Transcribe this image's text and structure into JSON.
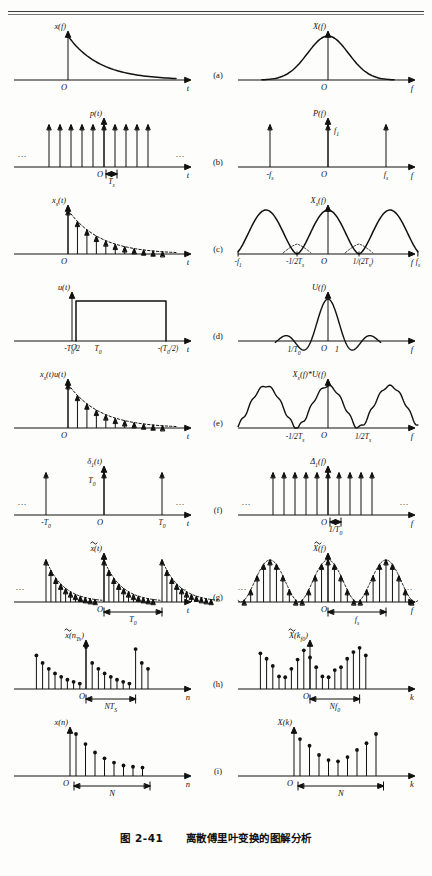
{
  "header": {
    "running_head": ""
  },
  "caption": {
    "figure_number": "图 2-41",
    "title": "离散傅里叶变换的图解分析"
  },
  "axes": {
    "t": "t",
    "f": "f",
    "n": "n",
    "k": "k",
    "origin": "O"
  },
  "rows": [
    {
      "key": "a",
      "label": "(a)",
      "left": {
        "name": "x(f)",
        "ylabel": "x(f)",
        "xlabel": "t",
        "kind": "exp-decay-curve",
        "description": "exponential decaying continuous signal starting at O"
      },
      "right": {
        "name": "X(f)",
        "ylabel": "X(f)",
        "xlabel": "f",
        "kind": "bell-curve",
        "description": "smooth bell shaped continuous spectrum centred at O"
      }
    },
    {
      "key": "b",
      "label": "(b)",
      "left": {
        "name": "p(t)",
        "ylabel": "p(t)",
        "xlabel": "t",
        "kind": "impulse-train",
        "ticks": [
          "O"
        ],
        "span_label": "T s",
        "ellipsis": "…"
      },
      "right": {
        "name": "P(f)",
        "ylabel": "P(f)",
        "xlabel": "f",
        "kind": "three-impulses",
        "ticks": [
          "-f s",
          "O",
          "f s"
        ],
        "amplitude_label": "f 1"
      }
    },
    {
      "key": "c",
      "label": "(c)",
      "left": {
        "name": "x s(t)",
        "ylabel": "x s(t)",
        "xlabel": "t",
        "kind": "sampled-exp",
        "ticks": [
          "O"
        ]
      },
      "right": {
        "name": "X s(f)",
        "ylabel": "X s(f)",
        "xlabel": "f",
        "kind": "periodic-spectrum",
        "ticks": [
          "-f 1",
          "-1/2T s",
          "O",
          "1/(2T s)",
          "f s"
        ]
      }
    },
    {
      "key": "d",
      "label": "(d)",
      "left": {
        "name": "u(t)",
        "ylabel": "u(t)",
        "xlabel": "t",
        "kind": "rect-window",
        "ticks": [
          "-T 0/2",
          "O",
          "T 0",
          "-(T 0/2)"
        ]
      },
      "right": {
        "name": "U(f)",
        "ylabel": "U(f)",
        "xlabel": "f",
        "kind": "sinc",
        "ticks": [
          "1/T 0",
          "O",
          "1"
        ]
      }
    },
    {
      "key": "e",
      "label": "(e)",
      "left": {
        "name": "x s(t)u(t)",
        "ylabel": "x s(t)u(t)",
        "xlabel": "t",
        "kind": "sampled-exp",
        "ticks": [
          "O"
        ]
      },
      "right": {
        "name": "X s(f)*U(f)",
        "ylabel": "X s(f)*U(f)",
        "xlabel": "f",
        "kind": "rippled-periodic",
        "ticks": [
          "-1/2T s",
          "O",
          "1/2T s"
        ]
      }
    },
    {
      "key": "f",
      "label": "(f)",
      "left": {
        "name": "δ 1(t)",
        "ylabel": "δ 1(t)",
        "xlabel": "t",
        "kind": "sparse-impulses",
        "ticks": [
          "-T 0",
          "O",
          "T 0"
        ],
        "amplitude_label": "T 0",
        "ellipsis": "…"
      },
      "right": {
        "name": "Δ 1(f)",
        "ylabel": "Δ 1(f)",
        "xlabel": "f",
        "kind": "impulse-train",
        "ticks": [
          "O"
        ],
        "span_label": "1/T 0",
        "ellipsis": "…"
      }
    },
    {
      "key": "g",
      "label": "(g)",
      "left": {
        "name": "x~(t)",
        "ylabel": "x(t)",
        "xlabel": "t",
        "kind": "periodic-sampled-exp",
        "span_label": "T 0",
        "ellipsis": "…",
        "tilde": true
      },
      "right": {
        "name": "X~(f)",
        "ylabel": "X(f)",
        "xlabel": "f",
        "kind": "periodic-sampled-spectrum",
        "span_label": "f s",
        "ellipsis": "…",
        "tilde": true
      }
    },
    {
      "key": "h",
      "label": "(h)",
      "left": {
        "name": "x~(nT s)",
        "ylabel": "x(n T s)",
        "xlabel": "n",
        "kind": "stem-sequence-decay",
        "span_label": "NT S",
        "tilde": true
      },
      "right": {
        "name": "X~(kf 0)",
        "ylabel": "X(k f 0)",
        "xlabel": "k",
        "kind": "stem-sequence-spectrum",
        "span_label": "Nf 0",
        "tilde": true
      }
    },
    {
      "key": "i",
      "label": "(i)",
      "left": {
        "name": "x(n)",
        "ylabel": "x(n)",
        "xlabel": "n",
        "kind": "stem-finite-decay",
        "span_label": "N"
      },
      "right": {
        "name": "X(k)",
        "ylabel": "X(k)",
        "xlabel": "k",
        "kind": "stem-finite-spectrum",
        "span_label": "N"
      }
    }
  ],
  "chart_data": {
    "type": "line",
    "title": "离散傅里叶变换的图解分析",
    "panels": [
      {
        "id": "a-left",
        "kind": "curve",
        "x": [
          0,
          0.1,
          0.2,
          0.3,
          0.4,
          0.5,
          0.6,
          0.7,
          0.8,
          0.9,
          1.0
        ],
        "y": [
          1.0,
          0.72,
          0.52,
          0.38,
          0.28,
          0.2,
          0.15,
          0.11,
          0.08,
          0.06,
          0.05
        ],
        "xlabel": "t",
        "ylabel": "x(f)"
      },
      {
        "id": "a-right",
        "kind": "curve",
        "x": [
          -1,
          -0.8,
          -0.6,
          -0.4,
          -0.2,
          0,
          0.2,
          0.4,
          0.6,
          0.8,
          1
        ],
        "y": [
          0.03,
          0.08,
          0.22,
          0.55,
          0.88,
          1.0,
          0.88,
          0.55,
          0.22,
          0.08,
          0.03
        ],
        "xlabel": "f",
        "ylabel": "X(f)"
      },
      {
        "id": "b-left",
        "kind": "impulses",
        "x": [
          -5,
          -4,
          -3,
          -2,
          -1,
          0,
          1,
          2,
          3,
          4
        ],
        "y": [
          1,
          1,
          1,
          1,
          1,
          1,
          1,
          1,
          1,
          1
        ],
        "xlabel": "t",
        "ylabel": "p(t)"
      },
      {
        "id": "b-right",
        "kind": "impulses",
        "x": [
          -1,
          0,
          1
        ],
        "y": [
          1,
          1,
          1
        ],
        "xlabel": "f",
        "ylabel": "P(f)"
      },
      {
        "id": "c-left",
        "kind": "impulses",
        "x": [
          0,
          1,
          2,
          3,
          4,
          5,
          6,
          7,
          8,
          9
        ],
        "y": [
          1.0,
          0.64,
          0.42,
          0.27,
          0.18,
          0.12,
          0.08,
          0.05,
          0.035,
          0.02
        ],
        "xlabel": "t",
        "ylabel": "x s(t)"
      },
      {
        "id": "c-right",
        "kind": "curve",
        "x": [
          -1,
          -0.75,
          -0.5,
          -0.25,
          0,
          0.25,
          0.5,
          0.75,
          1
        ],
        "y": [
          0.92,
          0.45,
          0.05,
          0.45,
          1.0,
          0.45,
          0.05,
          0.45,
          0.92
        ],
        "xlabel": "f",
        "ylabel": "X s(f)"
      },
      {
        "id": "d-left",
        "kind": "rect",
        "x": [
          -0.5,
          -0.5,
          0.5,
          0.5
        ],
        "y": [
          0,
          1,
          1,
          0
        ],
        "xlabel": "t",
        "ylabel": "u(t)"
      },
      {
        "id": "d-right",
        "kind": "sinc",
        "xlabel": "f",
        "ylabel": "U(f)"
      },
      {
        "id": "e-left",
        "kind": "impulses",
        "x": [
          0,
          1,
          2,
          3,
          4,
          5,
          6,
          7,
          8,
          9
        ],
        "y": [
          1.0,
          0.64,
          0.42,
          0.27,
          0.18,
          0.12,
          0.08,
          0.05,
          0.035,
          0.02
        ],
        "xlabel": "t",
        "ylabel": "x s(t)u(t)"
      },
      {
        "id": "e-right",
        "kind": "curve-rippled",
        "xlabel": "f",
        "ylabel": "X s(f)*U(f)"
      },
      {
        "id": "f-left",
        "kind": "impulses",
        "x": [
          -1,
          0,
          1
        ],
        "y": [
          1,
          1,
          1
        ],
        "xlabel": "t",
        "ylabel": "δ 1(t)"
      },
      {
        "id": "f-right",
        "kind": "impulses",
        "x": [
          -5,
          -4,
          -3,
          -2,
          -1,
          0,
          1,
          2,
          3,
          4
        ],
        "y": [
          1,
          1,
          1,
          1,
          1,
          1,
          1,
          1,
          1,
          1
        ],
        "xlabel": "f",
        "ylabel": "Δ 1(f)"
      },
      {
        "id": "g-left",
        "kind": "periodic-impulses",
        "xlabel": "t",
        "ylabel": "x(t)"
      },
      {
        "id": "g-right",
        "kind": "periodic-impulses",
        "xlabel": "f",
        "ylabel": "X(f)"
      },
      {
        "id": "h-left",
        "kind": "stems",
        "y": [
          0.8,
          0.62,
          0.48,
          0.37,
          0.29,
          0.22,
          0.17,
          0.13,
          1.0,
          0.62,
          0.48,
          0.37,
          0.29,
          0.22,
          0.17,
          0.13,
          0.95,
          0.62,
          0.48
        ],
        "xlabel": "n",
        "ylabel": "x(n T s)"
      },
      {
        "id": "h-right",
        "kind": "stems",
        "y": [
          0.85,
          0.72,
          0.55,
          0.3,
          0.28,
          0.48,
          0.7,
          0.92,
          0.75,
          0.52,
          0.3,
          0.28,
          0.45,
          0.52,
          0.72,
          0.88,
          0.98,
          0.8
        ],
        "xlabel": "k",
        "ylabel": "X(k f 0)"
      },
      {
        "id": "i-left",
        "kind": "stems",
        "y": [
          1.0,
          0.76,
          0.56,
          0.42,
          0.32,
          0.25,
          0.22,
          0.2
        ],
        "xlabel": "n",
        "ylabel": "x(n)"
      },
      {
        "id": "i-right",
        "kind": "stems",
        "y": [
          0.88,
          0.72,
          0.5,
          0.38,
          0.35,
          0.45,
          0.62,
          0.78,
          1.0
        ],
        "xlabel": "k",
        "ylabel": "X(k)"
      }
    ]
  }
}
